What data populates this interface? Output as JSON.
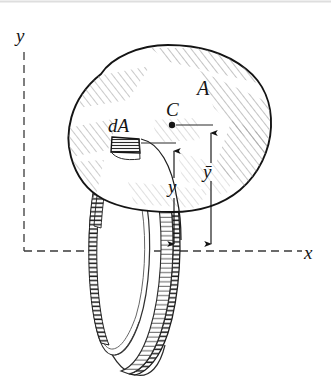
{
  "figure": {
    "background_color": "#ffffff",
    "ink_color": "#141414",
    "hatch_color": "#8c8c8c",
    "axes": {
      "x_label": "x",
      "y_label": "y",
      "x_axis_y_px": 251,
      "y_axis_x_px": 24,
      "dash_pattern": "8 5",
      "style": "dashed"
    },
    "labels": {
      "area": "A",
      "centroid": "C",
      "element": "dA",
      "distance_element": "y",
      "distance_centroid": "ȳ"
    },
    "dimensions": [
      {
        "name": "y",
        "label": "y",
        "from": "element dA",
        "to": "x axis",
        "line_x_px": 174,
        "top_y_px": 143,
        "bottom_y_px": 251,
        "label_x_px": 170,
        "label_y_px": 190
      },
      {
        "name": "y-bar",
        "label": "ȳ",
        "from": "centroid C",
        "to": "x axis",
        "line_x_px": 211,
        "top_y_px": 126,
        "bottom_y_px": 251,
        "label_x_px": 206,
        "label_y_px": 174
      }
    ],
    "centroid_point": {
      "x_px": 172,
      "y_px": 125,
      "radius_px": 3.2
    },
    "element_patch": {
      "name": "dA",
      "hatch": "horizontal",
      "x_px": 111,
      "y_px": 137,
      "width_px": 29,
      "height_px": 16
    }
  }
}
